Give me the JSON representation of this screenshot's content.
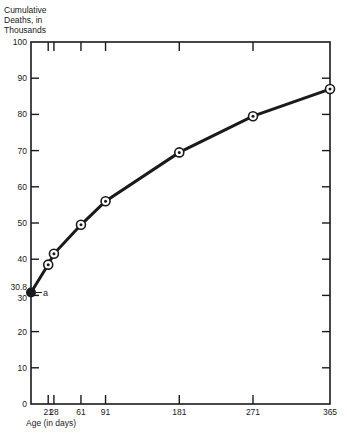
{
  "chart_data": {
    "type": "line",
    "title": "",
    "ylabel_lines": [
      "Cumulative",
      "Deaths, in",
      "Thousands"
    ],
    "xlabel": "Age (in days)",
    "x": [
      0,
      21,
      28,
      61,
      91,
      181,
      271,
      365
    ],
    "series": [
      {
        "name": "Cumulative deaths",
        "values": [
          30.8,
          38.5,
          41.5,
          49.5,
          56.0,
          69.5,
          79.5,
          87.0
        ]
      }
    ],
    "xticks": [
      21,
      28,
      61,
      91,
      181,
      271,
      365
    ],
    "yticks": [
      0,
      10,
      20,
      30,
      40,
      50,
      60,
      70,
      80,
      90,
      100
    ],
    "xlim": [
      0,
      365
    ],
    "ylim": [
      0,
      100
    ],
    "grid": false,
    "legend": null,
    "annotations": [
      {
        "text": "30.8",
        "x": 0,
        "y": 30.8,
        "position": "left-axis"
      },
      {
        "text": "a",
        "x": 0,
        "y": 30.8,
        "position": "right-of-point"
      }
    ]
  },
  "labels": {
    "ylabel_1": "Cumulative",
    "ylabel_2": "Deaths, in",
    "ylabel_3": "Thousands",
    "xlabel": "Age (in days)"
  }
}
